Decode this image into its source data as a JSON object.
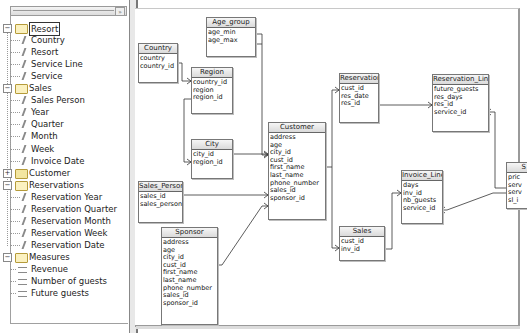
{
  "tree": {
    "header_button": "»",
    "groups": [
      {
        "label": "Resort",
        "expanded": true,
        "selected": true,
        "items": [
          {
            "label": "Country"
          },
          {
            "label": "Resort"
          },
          {
            "label": "Service Line"
          },
          {
            "label": "Service"
          }
        ]
      },
      {
        "label": "Sales",
        "expanded": true,
        "items": [
          {
            "label": "Sales Person"
          },
          {
            "label": "Year"
          },
          {
            "label": "Quarter"
          },
          {
            "label": "Month"
          },
          {
            "label": "Week"
          },
          {
            "label": "Invoice Date"
          }
        ]
      },
      {
        "label": "Customer",
        "expanded": false,
        "items": []
      },
      {
        "label": "Reservations",
        "expanded": true,
        "items": [
          {
            "label": "Reservation Year"
          },
          {
            "label": "Reservation Quarter"
          },
          {
            "label": "Reservation Month"
          },
          {
            "label": "Reservation Week"
          },
          {
            "label": "Reservation Date"
          }
        ]
      },
      {
        "label": "Measures",
        "expanded": true,
        "measures": true,
        "items": [
          {
            "label": "Revenue"
          },
          {
            "label": "Number of guests"
          },
          {
            "label": "Future guests"
          }
        ]
      }
    ]
  },
  "diagram": {
    "tables": {
      "age_group": {
        "title": "Age_group",
        "fields": [
          "age_min",
          "age_max"
        ]
      },
      "country": {
        "title": "Country",
        "fields": [
          "country",
          "country_id"
        ]
      },
      "region": {
        "title": "Region",
        "fields": [
          "country_id",
          "region",
          "region_id"
        ]
      },
      "city": {
        "title": "City",
        "fields": [
          "city_id",
          "region_id"
        ]
      },
      "customer": {
        "title": "Customer",
        "fields": [
          "address",
          "age",
          "city_id",
          "cust_id",
          "first_name",
          "last_name",
          "phone_number",
          "sales_id",
          "sponsor_id"
        ]
      },
      "sales_person": {
        "title": "Sales_Person",
        "fields": [
          "sales_id",
          "sales_person"
        ]
      },
      "sponsor": {
        "title": "Sponsor",
        "fields": [
          "address",
          "age",
          "city_id",
          "cust_id",
          "first_name",
          "last_name",
          "phone_number",
          "sales_id",
          "sponsor_id"
        ]
      },
      "reservations": {
        "title": "Reservations",
        "fields": [
          "cust_id",
          "res_date",
          "res_id"
        ]
      },
      "reservation_line": {
        "title": "Reservation_Line",
        "fields": [
          "future_guests",
          "res_days",
          "res_id",
          "service_id"
        ]
      },
      "invoice_line": {
        "title": "Invoice_Line",
        "fields": [
          "days",
          "inv_id",
          "nb_guests",
          "service_id"
        ]
      },
      "sales": {
        "title": "Sales",
        "fields": [
          "cust_id",
          "inv_id"
        ]
      },
      "service": {
        "title": "S",
        "fields": [
          "pric",
          "serv",
          "serv",
          "sl_i"
        ]
      }
    }
  }
}
